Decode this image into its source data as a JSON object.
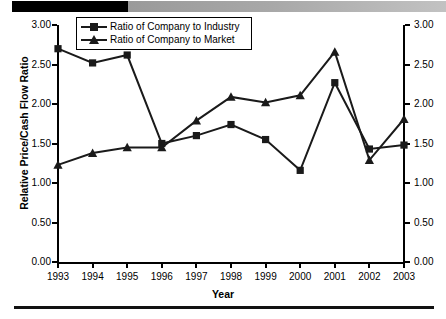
{
  "chart_data": {
    "type": "line",
    "title": "",
    "xlabel": "Year",
    "ylabel": "Relative Price/Cash Flow Ratio",
    "categories": [
      "1993",
      "1994",
      "1995",
      "1996",
      "1997",
      "1998",
      "1999",
      "2000",
      "2001",
      "2002",
      "2003"
    ],
    "x": [
      1993,
      1994,
      1995,
      1996,
      1997,
      1998,
      1999,
      2000,
      2001,
      2002,
      2003
    ],
    "ylim": [
      0.0,
      3.0
    ],
    "ytick_labels_left": [
      "3.00",
      "2.50",
      "2.00",
      "1.50",
      "1.00",
      "0.50",
      "0.00"
    ],
    "ytick_labels_right": [
      "3.00",
      "2.50",
      "2.00",
      "1.50",
      "1.00",
      "0.50",
      "0.00"
    ],
    "ytick_values": [
      3.0,
      2.5,
      2.0,
      1.5,
      1.0,
      0.5,
      0.0
    ],
    "grid": false,
    "legend_position": "top-left-inside",
    "dual_axis": true,
    "series": [
      {
        "name": "Ratio of Company to Industry",
        "marker": "square",
        "color": "#1a1a1a",
        "values": [
          2.7,
          2.52,
          2.62,
          1.5,
          1.6,
          1.74,
          1.55,
          1.16,
          2.27,
          1.43,
          1.48
        ]
      },
      {
        "name": "Ratio of Company to Market",
        "marker": "triangle",
        "color": "#1a1a1a",
        "values": [
          1.23,
          1.38,
          1.45,
          1.45,
          1.79,
          2.09,
          2.02,
          2.11,
          2.66,
          1.29,
          1.81
        ]
      }
    ]
  },
  "legend": {
    "items": [
      {
        "label": "Ratio of Company to Industry",
        "marker": "square"
      },
      {
        "label": "Ratio of Company to Market",
        "marker": "triangle"
      }
    ]
  },
  "axes": {
    "y_title": "Relative Price/Cash Flow Ratio",
    "x_title": "Year"
  },
  "colors": {
    "series": "#1a1a1a",
    "axis": "#000000",
    "background": "#ffffff",
    "bar_black": "#000000",
    "bar_gray": "#a8a8a8"
  }
}
